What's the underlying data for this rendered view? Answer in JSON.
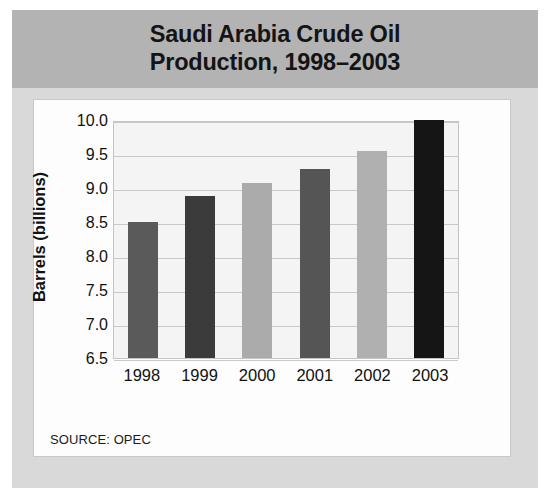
{
  "title": {
    "line1": "Saudi Arabia Crude Oil",
    "line2": "Production, 1998–2003"
  },
  "source_note": "SOURCE: OPEC",
  "chart_data": {
    "type": "bar",
    "title": "Saudi Arabia Crude Oil Production, 1998–2003",
    "xlabel": "",
    "ylabel": "Barrels (billions)",
    "categories": [
      "1998",
      "1999",
      "2000",
      "2001",
      "2002",
      "2003"
    ],
    "values": [
      8.5,
      8.88,
      9.08,
      9.28,
      9.55,
      10.0
    ],
    "bar_colors": [
      "#5a5a5a",
      "#3b3b3b",
      "#ababab",
      "#555555",
      "#b0b0b0",
      "#151515"
    ],
    "ylim": [
      6.5,
      10.0
    ],
    "yticks": [
      "10.0",
      "9.5",
      "9.0",
      "8.5",
      "8.0",
      "7.5",
      "7.0",
      "6.5"
    ],
    "ytick_values": [
      10.0,
      9.5,
      9.0,
      8.5,
      8.0,
      7.5,
      7.0,
      6.5
    ],
    "grid": true,
    "legend": "none",
    "plot_background": "#f4f4f4",
    "banner_color": "#b3b3b3",
    "card_background": "#fdfdfd",
    "page_background": "#d9d9d9"
  }
}
